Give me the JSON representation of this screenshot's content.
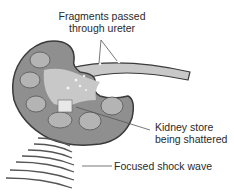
{
  "diagram": {
    "labels": {
      "fragments_line1": "Fragments passed",
      "fragments_line2": "through ureter",
      "stone_line1": "Kidney store",
      "stone_line2": "being shattered",
      "shock_wave": "Focused shock wave"
    },
    "colors": {
      "kidney_fill": "#8f8f8f",
      "kidney_outline": "#3a3a3a",
      "inner_fill": "#c8c8c8",
      "calyx_fill": "#b4b4b4",
      "wave_stroke": "#555555",
      "leader_line": "#555555"
    }
  }
}
